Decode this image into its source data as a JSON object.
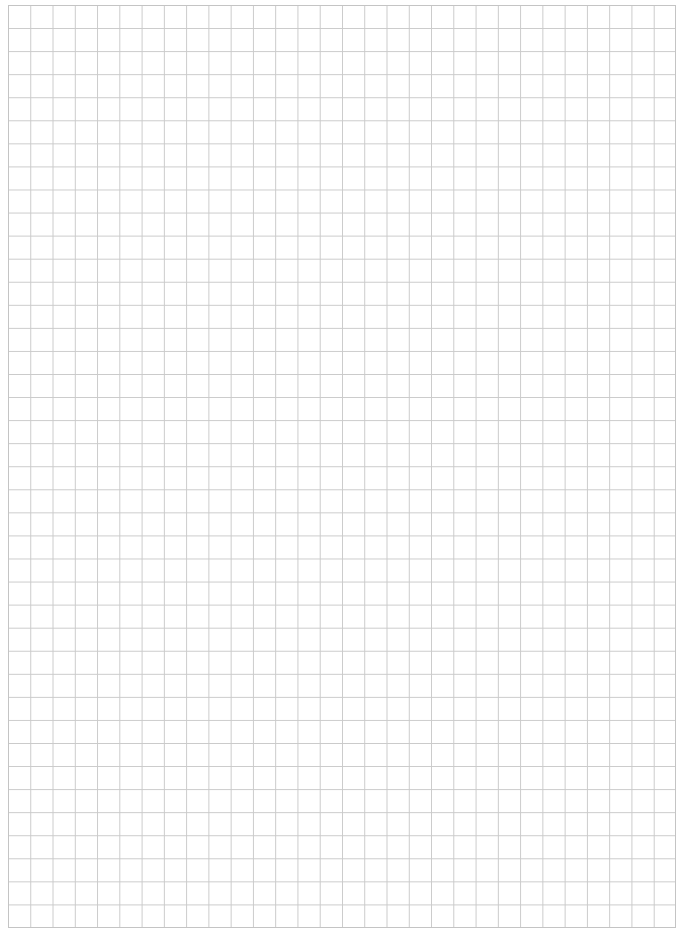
{
  "page": {
    "type": "blank grid paper",
    "grid": {
      "columns": 30,
      "rows": 40,
      "line_color": "#cacaca",
      "background_color": "#ffffff"
    }
  }
}
